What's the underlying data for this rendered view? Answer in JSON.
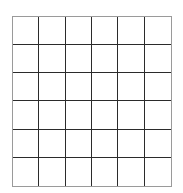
{
  "grid": {
    "rows": 6,
    "cols": 6,
    "line_color": "#2b2b2b",
    "border_color": "#9a9a9a",
    "cell_fill": "#ffffff",
    "background": "#ffffff"
  }
}
